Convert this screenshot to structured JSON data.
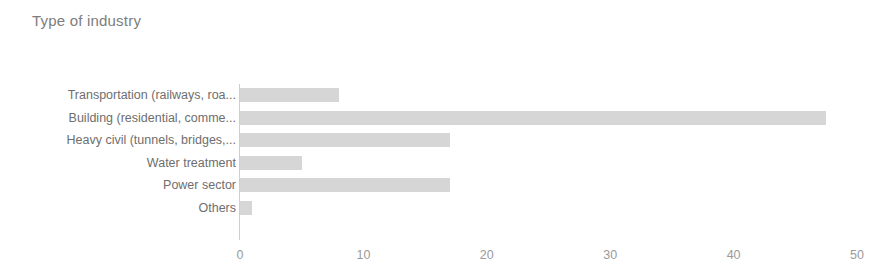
{
  "chart_data": {
    "type": "bar",
    "orientation": "horizontal",
    "title": "Type of industry",
    "xlabel": "",
    "ylabel": "",
    "xlim": [
      0,
      50
    ],
    "xticks": [
      0,
      10,
      20,
      30,
      40,
      50
    ],
    "grid": false,
    "legend": false,
    "bar_color": "#d6d6d6",
    "text_color": "#6e6e6e",
    "categories": [
      "Transportation (railways, roa...",
      "Building (residential, comme...",
      "Heavy civil (tunnels, bridges,...",
      "Water treatment",
      "Power sector",
      "Others"
    ],
    "values": [
      8,
      47.5,
      17,
      5,
      17,
      1
    ]
  }
}
